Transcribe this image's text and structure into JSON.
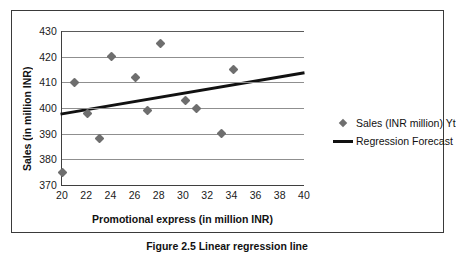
{
  "figure": {
    "caption": "Figure 2.5   Linear regression line"
  },
  "legend": {
    "position": "right",
    "entries": [
      {
        "label": "Sales (INR million) Yt",
        "marker": "diamond-icon"
      },
      {
        "label": "Regression Forecast",
        "marker": "line-icon"
      }
    ]
  },
  "chart_data": {
    "type": "scatter",
    "title": "",
    "xlabel": "Promotional express (in million INR)",
    "ylabel": "Sales (in million INR)",
    "xlim": [
      20,
      40
    ],
    "ylim": [
      370,
      430
    ],
    "xticks": [
      20,
      22,
      24,
      26,
      28,
      30,
      32,
      34,
      36,
      38,
      40
    ],
    "yticks": [
      370,
      380,
      390,
      400,
      410,
      420,
      430
    ],
    "grid": "horizontal",
    "series": [
      {
        "name": "Sales (INR million) Yt",
        "type": "scatter",
        "marker": "diamond",
        "color": "#6e6e6e",
        "points": [
          [
            20.0,
            375
          ],
          [
            21.0,
            410
          ],
          [
            22.1,
            398
          ],
          [
            23.1,
            388
          ],
          [
            24.1,
            420
          ],
          [
            26.1,
            412
          ],
          [
            27.1,
            399
          ],
          [
            28.1,
            425
          ],
          [
            30.2,
            403
          ],
          [
            31.1,
            400
          ],
          [
            33.2,
            390
          ],
          [
            34.2,
            415
          ]
        ]
      },
      {
        "name": "Regression Forecast",
        "type": "line",
        "color": "#111111",
        "width": 3,
        "endpoints": [
          [
            20,
            397.5
          ],
          [
            40,
            413.5
          ]
        ]
      }
    ]
  }
}
